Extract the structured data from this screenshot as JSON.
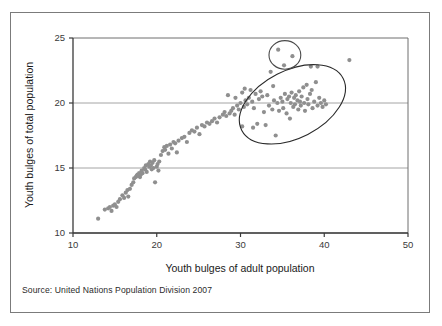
{
  "chart_data": {
    "type": "scatter",
    "title": "",
    "xlabel": "Youth bulges of adult population",
    "ylabel": "Youth bulges of total population",
    "xlim": [
      10,
      50
    ],
    "ylim": [
      10,
      25
    ],
    "xticks": [
      10,
      20,
      30,
      40,
      50
    ],
    "yticks": [
      10,
      15,
      20,
      25
    ],
    "xtick_labels": [
      "10",
      "20",
      "30",
      "40",
      "50"
    ],
    "ytick_labels": [
      "10",
      "15",
      "20",
      "25"
    ],
    "grid": "horizontal",
    "legend": "none",
    "point_color": "#8f8f8f",
    "point_size": 3.1,
    "series": [
      {
        "name": "countries",
        "points": [
          [
            13.0,
            11.1
          ],
          [
            13.8,
            11.8
          ],
          [
            14.2,
            11.9
          ],
          [
            14.4,
            12.0
          ],
          [
            14.6,
            11.7
          ],
          [
            14.8,
            12.1
          ],
          [
            15.0,
            12.2
          ],
          [
            15.2,
            12.0
          ],
          [
            15.4,
            12.4
          ],
          [
            15.6,
            12.6
          ],
          [
            15.9,
            12.9
          ],
          [
            16.1,
            12.7
          ],
          [
            16.3,
            13.1
          ],
          [
            16.5,
            13.3
          ],
          [
            16.6,
            12.8
          ],
          [
            16.8,
            13.4
          ],
          [
            17.0,
            13.7
          ],
          [
            17.2,
            13.9
          ],
          [
            17.3,
            14.2
          ],
          [
            17.5,
            14.3
          ],
          [
            17.6,
            14.4
          ],
          [
            17.7,
            14.5
          ],
          [
            17.8,
            14.4
          ],
          [
            17.9,
            14.6
          ],
          [
            18.0,
            14.3
          ],
          [
            18.1,
            14.5
          ],
          [
            18.2,
            14.8
          ],
          [
            18.3,
            14.6
          ],
          [
            18.5,
            15.0
          ],
          [
            18.6,
            14.9
          ],
          [
            18.7,
            15.2
          ],
          [
            18.8,
            14.7
          ],
          [
            19.0,
            15.3
          ],
          [
            19.1,
            15.1
          ],
          [
            19.2,
            15.5
          ],
          [
            19.3,
            15.2
          ],
          [
            19.4,
            14.9
          ],
          [
            19.5,
            15.4
          ],
          [
            19.6,
            15.0
          ],
          [
            19.7,
            15.6
          ],
          [
            19.8,
            13.9
          ],
          [
            20.0,
            15.1
          ],
          [
            20.1,
            15.3
          ],
          [
            20.2,
            14.8
          ],
          [
            20.3,
            15.5
          ],
          [
            20.5,
            16.0
          ],
          [
            20.7,
            16.3
          ],
          [
            20.9,
            16.6
          ],
          [
            21.0,
            16.4
          ],
          [
            21.2,
            16.7
          ],
          [
            21.4,
            16.1
          ],
          [
            21.6,
            16.8
          ],
          [
            21.8,
            16.5
          ],
          [
            22.0,
            17.0
          ],
          [
            22.2,
            16.9
          ],
          [
            22.4,
            16.2
          ],
          [
            22.6,
            17.1
          ],
          [
            23.0,
            17.3
          ],
          [
            23.3,
            17.4
          ],
          [
            23.6,
            17.0
          ],
          [
            23.9,
            17.7
          ],
          [
            24.2,
            17.9
          ],
          [
            24.5,
            17.8
          ],
          [
            24.8,
            18.1
          ],
          [
            25.1,
            17.6
          ],
          [
            25.4,
            18.3
          ],
          [
            25.7,
            18.2
          ],
          [
            26.0,
            18.5
          ],
          [
            26.3,
            18.4
          ],
          [
            26.6,
            18.6
          ],
          [
            26.9,
            18.8
          ],
          [
            27.2,
            18.5
          ],
          [
            27.5,
            18.9
          ],
          [
            27.9,
            19.1
          ],
          [
            28.1,
            19.3
          ],
          [
            28.3,
            19.0
          ],
          [
            28.5,
            20.6
          ],
          [
            28.7,
            19.2
          ],
          [
            28.9,
            19.4
          ],
          [
            29.1,
            19.6
          ],
          [
            29.3,
            19.1
          ],
          [
            29.6,
            19.8
          ],
          [
            29.8,
            19.5
          ],
          [
            30.0,
            20.0
          ],
          [
            30.2,
            20.8
          ],
          [
            30.4,
            19.7
          ],
          [
            30.6,
            20.2
          ],
          [
            30.8,
            19.9
          ],
          [
            31.0,
            20.4
          ],
          [
            31.2,
            21.0
          ],
          [
            31.4,
            20.1
          ],
          [
            31.6,
            19.6
          ],
          [
            31.8,
            20.7
          ],
          [
            32.0,
            18.4
          ],
          [
            32.2,
            20.3
          ],
          [
            32.4,
            20.9
          ],
          [
            32.6,
            20.5
          ],
          [
            32.8,
            19.3
          ],
          [
            33.0,
            18.3
          ],
          [
            33.2,
            20.6
          ],
          [
            33.4,
            19.8
          ],
          [
            33.6,
            22.4
          ],
          [
            33.8,
            19.5
          ],
          [
            34.0,
            20.2
          ],
          [
            34.2,
            17.5
          ],
          [
            34.4,
            20.0
          ],
          [
            34.6,
            19.4
          ],
          [
            34.8,
            20.4
          ],
          [
            35.0,
            20.1
          ],
          [
            35.1,
            19.6
          ],
          [
            35.3,
            20.7
          ],
          [
            35.5,
            19.2
          ],
          [
            35.6,
            20.3
          ],
          [
            35.8,
            20.5
          ],
          [
            35.9,
            18.8
          ],
          [
            36.0,
            20.0
          ],
          [
            36.1,
            20.8
          ],
          [
            36.3,
            19.7
          ],
          [
            36.4,
            20.4
          ],
          [
            36.5,
            19.9
          ],
          [
            36.6,
            20.6
          ],
          [
            36.8,
            20.2
          ],
          [
            36.9,
            19.5
          ],
          [
            37.0,
            20.9
          ],
          [
            37.1,
            20.1
          ],
          [
            37.2,
            19.8
          ],
          [
            37.3,
            20.5
          ],
          [
            37.5,
            21.2
          ],
          [
            37.6,
            20.0
          ],
          [
            37.7,
            19.4
          ],
          [
            37.9,
            21.4
          ],
          [
            38.0,
            20.3
          ],
          [
            38.1,
            19.9
          ],
          [
            38.3,
            20.7
          ],
          [
            38.5,
            21.0
          ],
          [
            38.6,
            19.6
          ],
          [
            38.8,
            20.1
          ],
          [
            39.0,
            21.6
          ],
          [
            39.2,
            19.8
          ],
          [
            39.4,
            20.4
          ],
          [
            39.6,
            20.0
          ],
          [
            39.8,
            19.7
          ],
          [
            40.0,
            20.2
          ],
          [
            40.2,
            19.9
          ],
          [
            35.2,
            22.9
          ],
          [
            34.5,
            24.1
          ],
          [
            36.2,
            23.6
          ],
          [
            38.4,
            22.8
          ],
          [
            39.2,
            22.8
          ],
          [
            43.0,
            23.3
          ],
          [
            30.5,
            21.1
          ],
          [
            29.4,
            20.4
          ],
          [
            33.9,
            21.3
          ],
          [
            31.5,
            18.1
          ],
          [
            30.2,
            18.2
          ]
        ]
      }
    ],
    "annotations": [
      {
        "type": "ellipse",
        "name": "main-cluster-ellipse",
        "cx": 36.2,
        "cy": 19.9,
        "rx": 6.8,
        "ry": 2.6,
        "rotation": -27,
        "stroke": "#2a2a2a"
      },
      {
        "type": "ellipse",
        "name": "outlier-circle",
        "cx": 35.3,
        "cy": 23.7,
        "rx": 1.9,
        "ry": 1.1,
        "rotation": 0,
        "stroke": "#4a4a4a"
      }
    ]
  },
  "source": {
    "text": "Source: United Nations Population Division 2007"
  }
}
